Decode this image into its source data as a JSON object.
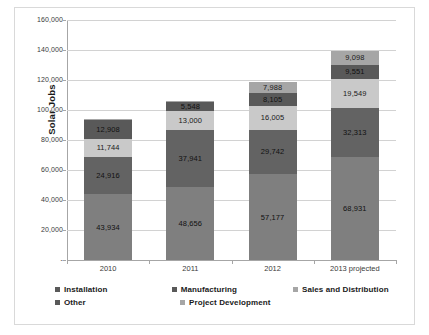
{
  "chart_data": {
    "type": "bar",
    "stacked": true,
    "title": "",
    "xlabel": "",
    "ylabel": "Solar Jobs",
    "categories": [
      "2010",
      "2011",
      "2012",
      "2013 projected"
    ],
    "ylim": [
      0,
      160000
    ],
    "yticks": [
      "-",
      "20,000",
      "40,000",
      "60,000",
      "80,000",
      "100,000",
      "120,000",
      "140,000",
      "160,000"
    ],
    "ytick_values": [
      0,
      20000,
      40000,
      60000,
      80000,
      100000,
      120000,
      140000,
      160000
    ],
    "grid": true,
    "legend_position": "bottom",
    "series": [
      {
        "name": "Installation",
        "color": "#7f7f7f",
        "values": [
          43934,
          48656,
          57177,
          68931
        ],
        "labels": [
          "43,934",
          "48,656",
          "57,177",
          "68,931"
        ]
      },
      {
        "name": "Manufacturing",
        "color": "#636363",
        "values": [
          24916,
          37941,
          29742,
          32313
        ],
        "labels": [
          "24,916",
          "37,941",
          "29,742",
          "32,313"
        ]
      },
      {
        "name": "Sales and Distribution",
        "color": "#c9c9c9",
        "values": [
          11744,
          13000,
          16005,
          19549
        ],
        "labels": [
          "11,744",
          "13,000",
          "16,005",
          "19,549"
        ]
      },
      {
        "name": "Other",
        "color": "#595959",
        "values": [
          12908,
          5548,
          8105,
          9551
        ],
        "labels": [
          "12,908",
          "5,548",
          "8,105",
          "9,551"
        ]
      },
      {
        "name": "Project Development",
        "color": "#a6a6a6",
        "values": [
          600,
          600,
          7988,
          9098
        ],
        "labels": [
          "",
          "",
          "7,988",
          "9,098"
        ]
      }
    ],
    "totals": [
      94102,
      105745,
      119017,
      139442
    ]
  },
  "legend": {
    "row1": [
      {
        "label": "Installation",
        "color": "#595959"
      },
      {
        "label": "Manufacturing",
        "color": "#595959"
      },
      {
        "label": "Sales and Distribution",
        "color": "#a6a6a6"
      }
    ],
    "row2": [
      {
        "label": "Other",
        "color": "#595959"
      },
      {
        "label": "Project Development",
        "color": "#a6a6a6"
      }
    ]
  }
}
